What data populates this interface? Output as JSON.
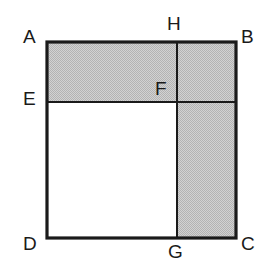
{
  "figure": {
    "type": "geometry-diagram",
    "colors": {
      "stroke": "#1a1a1a",
      "shading": "#c4c4c4",
      "background": "#ffffff",
      "label_color": "#1a1a1a"
    },
    "stroke_width_outer": 3,
    "stroke_width_inner": 2,
    "square": {
      "name": "ABCD",
      "left": 47,
      "top": 42,
      "right": 236,
      "bottom": 238
    },
    "divider_vertical_x": 177,
    "divider_horizontal_y": 102,
    "points": [
      {
        "id": "A",
        "label": "A",
        "x": 47,
        "y": 42,
        "label_x": 23,
        "label_y": 27,
        "corner": "top-left"
      },
      {
        "id": "B",
        "label": "B",
        "x": 236,
        "y": 42,
        "label_x": 241,
        "label_y": 27,
        "corner": "top-right"
      },
      {
        "id": "C",
        "label": "C",
        "x": 236,
        "y": 238,
        "label_x": 241,
        "label_y": 234,
        "corner": "bottom-right"
      },
      {
        "id": "D",
        "label": "D",
        "x": 47,
        "y": 238,
        "label_x": 23,
        "label_y": 234,
        "corner": "bottom-left"
      },
      {
        "id": "E",
        "label": "E",
        "x": 47,
        "y": 102,
        "label_x": 23,
        "label_y": 89,
        "corner": "left-mid"
      },
      {
        "id": "F",
        "label": "F",
        "x": 177,
        "y": 102,
        "label_x": 155,
        "label_y": 79,
        "corner": "interior"
      },
      {
        "id": "G",
        "label": "G",
        "x": 177,
        "y": 238,
        "label_x": 168,
        "label_y": 242,
        "corner": "bottom-mid"
      },
      {
        "id": "H",
        "label": "H",
        "x": 177,
        "y": 42,
        "label_x": 167,
        "label_y": 14,
        "corner": "top-mid"
      }
    ],
    "shaded_regions": [
      {
        "name": "top-band-AEFH-B",
        "x": 47,
        "y": 42,
        "width": 189,
        "height": 60
      },
      {
        "name": "right-column-FBCG",
        "x": 177,
        "y": 102,
        "width": 59,
        "height": 136
      }
    ],
    "segments": [
      {
        "name": "side-AB",
        "x1": 47,
        "y1": 42,
        "x2": 236,
        "y2": 42,
        "weight": "outer"
      },
      {
        "name": "side-BC",
        "x1": 236,
        "y1": 42,
        "x2": 236,
        "y2": 238,
        "weight": "outer"
      },
      {
        "name": "side-CD",
        "x1": 236,
        "y1": 238,
        "x2": 47,
        "y2": 238,
        "weight": "outer"
      },
      {
        "name": "side-DA",
        "x1": 47,
        "y1": 238,
        "x2": 47,
        "y2": 42,
        "weight": "outer"
      },
      {
        "name": "segment-EB",
        "x1": 47,
        "y1": 102,
        "x2": 236,
        "y2": 102,
        "weight": "inner"
      },
      {
        "name": "segment-HG",
        "x1": 177,
        "y1": 42,
        "x2": 177,
        "y2": 238,
        "weight": "inner"
      }
    ]
  }
}
